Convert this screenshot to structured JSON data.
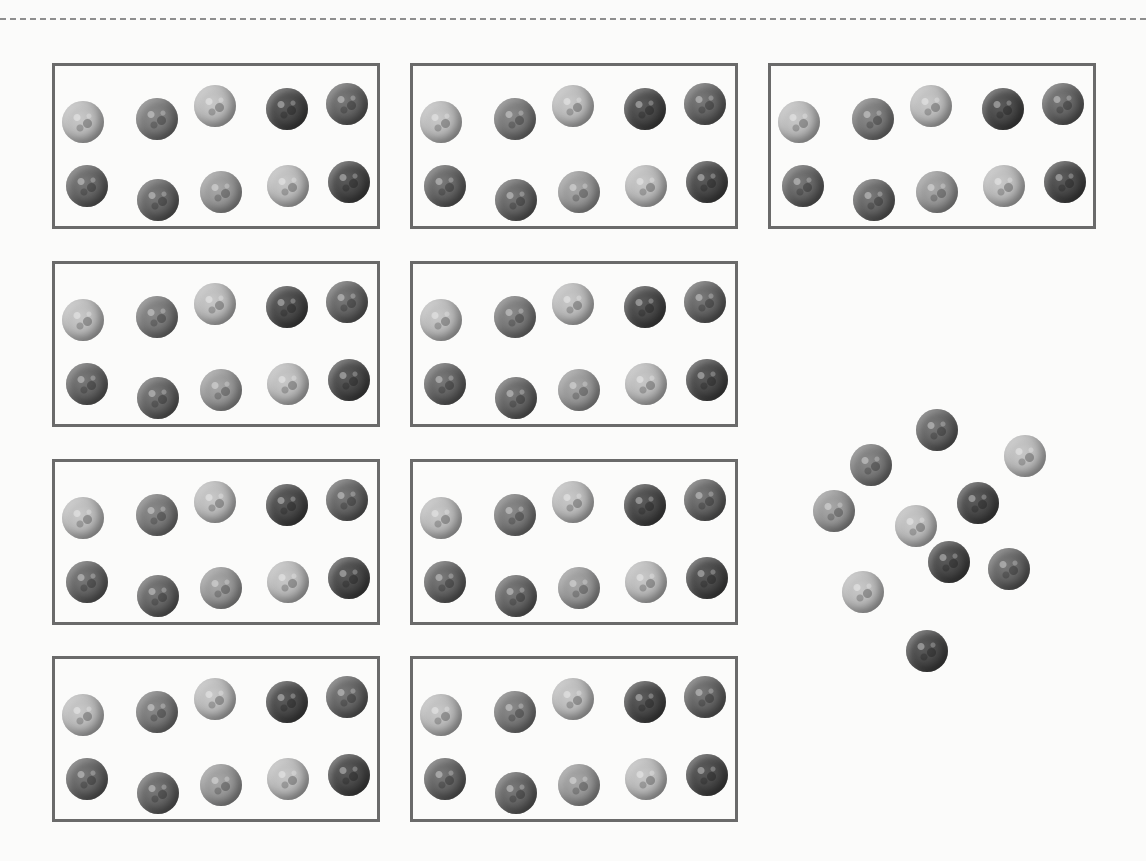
{
  "colors": {
    "box_border": "#6a6a6a",
    "background": "#fbfbfa",
    "dash": "#8e8e8e"
  },
  "summary": {
    "boxed_groups": 9,
    "marbles_per_group": 10,
    "loose_marbles": 10,
    "total_marbles": 100
  },
  "group_template": [
    {
      "x": 28,
      "y": 56,
      "shade": "light"
    },
    {
      "x": 102,
      "y": 53,
      "shade": "mid"
    },
    {
      "x": 160,
      "y": 40,
      "shade": "light"
    },
    {
      "x": 232,
      "y": 43,
      "shade": "dark"
    },
    {
      "x": 292,
      "y": 38,
      "shade": "speckle"
    },
    {
      "x": 32,
      "y": 120,
      "shade": "speckle"
    },
    {
      "x": 103,
      "y": 134,
      "shade": "speckle"
    },
    {
      "x": 166,
      "y": 126,
      "shade": "midlight"
    },
    {
      "x": 233,
      "y": 120,
      "shade": "light"
    },
    {
      "x": 294,
      "y": 116,
      "shade": "dark"
    }
  ],
  "groups": [
    {
      "x": 52,
      "y": 63
    },
    {
      "x": 410,
      "y": 63
    },
    {
      "x": 768,
      "y": 63
    },
    {
      "x": 52,
      "y": 261
    },
    {
      "x": 410,
      "y": 261
    },
    {
      "x": 52,
      "y": 459
    },
    {
      "x": 410,
      "y": 459
    },
    {
      "x": 52,
      "y": 656
    },
    {
      "x": 410,
      "y": 656
    }
  ],
  "loose_marbles": [
    {
      "x": 916,
      "y": 409,
      "shade": "speckle"
    },
    {
      "x": 850,
      "y": 444,
      "shade": "mid"
    },
    {
      "x": 1004,
      "y": 435,
      "shade": "light"
    },
    {
      "x": 813,
      "y": 490,
      "shade": "midlight"
    },
    {
      "x": 957,
      "y": 482,
      "shade": "dark"
    },
    {
      "x": 895,
      "y": 505,
      "shade": "light"
    },
    {
      "x": 928,
      "y": 541,
      "shade": "dark"
    },
    {
      "x": 988,
      "y": 548,
      "shade": "speckle"
    },
    {
      "x": 842,
      "y": 571,
      "shade": "light"
    },
    {
      "x": 906,
      "y": 630,
      "shade": "dark"
    }
  ]
}
